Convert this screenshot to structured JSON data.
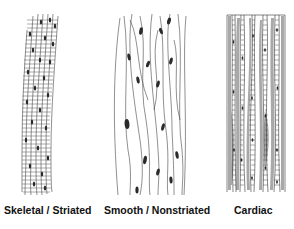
{
  "diagram": {
    "panels": [
      {
        "id": "skeletal",
        "label": "Skeletal / Striated"
      },
      {
        "id": "smooth",
        "label": "Smooth / Nonstriated"
      },
      {
        "id": "cardiac",
        "label": "Cardiac"
      }
    ],
    "colors": {
      "line": "#333333",
      "nucleus": "#2a2a2a",
      "cardiac_fill": "#9a9a9a",
      "background": "#ffffff"
    }
  }
}
